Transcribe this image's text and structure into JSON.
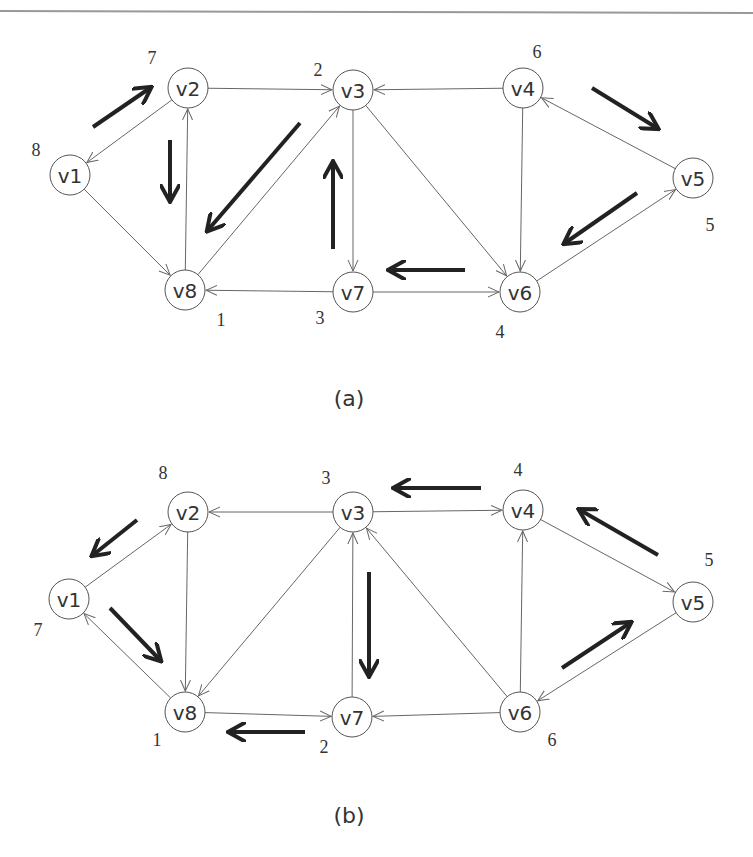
{
  "figures": [
    {
      "id": "a",
      "caption": "(a)",
      "caption_pos": [
        349,
        398
      ],
      "nodes": [
        {
          "id": "v1",
          "label": "v1",
          "x": 70,
          "y": 175,
          "order": "8",
          "order_pos": [
            36,
            150
          ]
        },
        {
          "id": "v2",
          "label": "v2",
          "x": 188,
          "y": 88,
          "order": "7",
          "order_pos": [
            152,
            58
          ]
        },
        {
          "id": "v3",
          "label": "v3",
          "x": 353,
          "y": 90,
          "order": "2",
          "order_pos": [
            318,
            70
          ]
        },
        {
          "id": "v4",
          "label": "v4",
          "x": 523,
          "y": 88,
          "order": "6",
          "order_pos": [
            537,
            52
          ]
        },
        {
          "id": "v5",
          "label": "v5",
          "x": 693,
          "y": 178,
          "order": "5",
          "order_pos": [
            710,
            225
          ]
        },
        {
          "id": "v6",
          "label": "v6",
          "x": 520,
          "y": 292,
          "order": "4",
          "order_pos": [
            500,
            332
          ]
        },
        {
          "id": "v7",
          "label": "v7",
          "x": 353,
          "y": 292,
          "order": "3",
          "order_pos": [
            320,
            318
          ]
        },
        {
          "id": "v8",
          "label": "v8",
          "x": 185,
          "y": 290,
          "order": "1",
          "order_pos": [
            221,
            320
          ]
        }
      ],
      "edges": [
        {
          "from": "v2",
          "to": "v1"
        },
        {
          "from": "v2",
          "to": "v3"
        },
        {
          "from": "v1",
          "to": "v8"
        },
        {
          "from": "v8",
          "to": "v2"
        },
        {
          "from": "v8",
          "to": "v3"
        },
        {
          "from": "v4",
          "to": "v3"
        },
        {
          "from": "v3",
          "to": "v7"
        },
        {
          "from": "v3",
          "to": "v6"
        },
        {
          "from": "v4",
          "to": "v6"
        },
        {
          "from": "v5",
          "to": "v4"
        },
        {
          "from": "v6",
          "to": "v5"
        },
        {
          "from": "v7",
          "to": "v8"
        },
        {
          "from": "v7",
          "to": "v6"
        }
      ],
      "traversal_arrows": [
        {
          "x1": 93,
          "y1": 127,
          "x2": 150,
          "y2": 88
        },
        {
          "x1": 170,
          "y1": 140,
          "x2": 170,
          "y2": 200
        },
        {
          "x1": 300,
          "y1": 123,
          "x2": 208,
          "y2": 230
        },
        {
          "x1": 333,
          "y1": 249,
          "x2": 333,
          "y2": 163
        },
        {
          "x1": 465,
          "y1": 270,
          "x2": 390,
          "y2": 270
        },
        {
          "x1": 637,
          "y1": 193,
          "x2": 565,
          "y2": 243
        },
        {
          "x1": 592,
          "y1": 88,
          "x2": 657,
          "y2": 128
        }
      ]
    },
    {
      "id": "b",
      "caption": "(b)",
      "caption_pos": [
        349,
        815
      ],
      "nodes": [
        {
          "id": "v1",
          "label": "v1",
          "x": 69,
          "y": 599,
          "order": "7",
          "order_pos": [
            38,
            630
          ]
        },
        {
          "id": "v2",
          "label": "v2",
          "x": 188,
          "y": 512,
          "order": "8",
          "order_pos": [
            163,
            473
          ]
        },
        {
          "id": "v3",
          "label": "v3",
          "x": 353,
          "y": 512,
          "order": "3",
          "order_pos": [
            326,
            478
          ]
        },
        {
          "id": "v4",
          "label": "v4",
          "x": 523,
          "y": 510,
          "order": "4",
          "order_pos": [
            518,
            470
          ]
        },
        {
          "id": "v5",
          "label": "v5",
          "x": 693,
          "y": 602,
          "order": "5",
          "order_pos": [
            709,
            560
          ]
        },
        {
          "id": "v6",
          "label": "v6",
          "x": 520,
          "y": 712,
          "order": "6",
          "order_pos": [
            552,
            740
          ]
        },
        {
          "id": "v7",
          "label": "v7",
          "x": 352,
          "y": 717,
          "order": "2",
          "order_pos": [
            324,
            747
          ]
        },
        {
          "id": "v8",
          "label": "v8",
          "x": 185,
          "y": 712,
          "order": "1",
          "order_pos": [
            157,
            740
          ]
        }
      ],
      "edges": [
        {
          "from": "v1",
          "to": "v2"
        },
        {
          "from": "v3",
          "to": "v2"
        },
        {
          "from": "v8",
          "to": "v1"
        },
        {
          "from": "v2",
          "to": "v8"
        },
        {
          "from": "v3",
          "to": "v8"
        },
        {
          "from": "v3",
          "to": "v4"
        },
        {
          "from": "v7",
          "to": "v3"
        },
        {
          "from": "v6",
          "to": "v3"
        },
        {
          "from": "v6",
          "to": "v4"
        },
        {
          "from": "v4",
          "to": "v5"
        },
        {
          "from": "v5",
          "to": "v6"
        },
        {
          "from": "v8",
          "to": "v7"
        },
        {
          "from": "v6",
          "to": "v7"
        }
      ],
      "traversal_arrows": [
        {
          "x1": 137,
          "y1": 520,
          "x2": 93,
          "y2": 555
        },
        {
          "x1": 110,
          "y1": 608,
          "x2": 160,
          "y2": 660
        },
        {
          "x1": 305,
          "y1": 732,
          "x2": 230,
          "y2": 732
        },
        {
          "x1": 369,
          "y1": 572,
          "x2": 369,
          "y2": 675
        },
        {
          "x1": 481,
          "y1": 488,
          "x2": 395,
          "y2": 488
        },
        {
          "x1": 658,
          "y1": 555,
          "x2": 580,
          "y2": 510
        },
        {
          "x1": 562,
          "y1": 668,
          "x2": 630,
          "y2": 623
        }
      ]
    }
  ],
  "style": {
    "node_radius": 20,
    "edge_color": "#666666",
    "thick_arrow_color": "#222222",
    "node_stroke": "#555555",
    "text_color": "#333333",
    "top_rule_color": "#999999"
  }
}
